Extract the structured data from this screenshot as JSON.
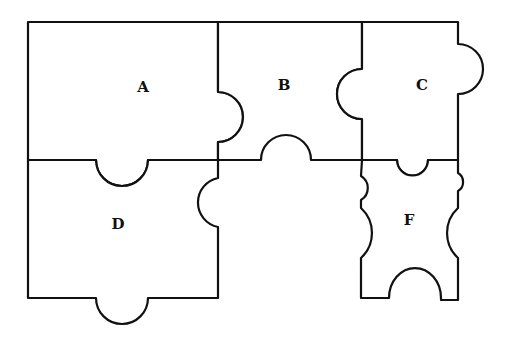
{
  "diagram": {
    "type": "jigsaw-puzzle-pieces",
    "stroke_color": "#111111",
    "background": "#ffffff",
    "pieces": [
      {
        "id": "A",
        "label": "A",
        "x": 143,
        "y": 87
      },
      {
        "id": "B",
        "label": "B",
        "x": 284,
        "y": 85
      },
      {
        "id": "C",
        "label": "C",
        "x": 422,
        "y": 85
      },
      {
        "id": "D",
        "label": "D",
        "x": 118,
        "y": 224
      },
      {
        "id": "E",
        "label": "",
        "x": 290,
        "y": 225
      },
      {
        "id": "F",
        "label": "F",
        "x": 409,
        "y": 220
      }
    ]
  }
}
